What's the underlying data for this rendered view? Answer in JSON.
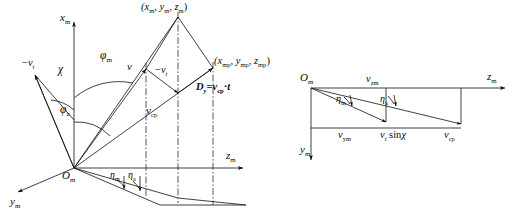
{
  "figure": {
    "type": "technical-line-diagram",
    "panels": [
      "left-3d-geometry",
      "right-velocity-triangle"
    ],
    "stroke_color": "#101010",
    "background": "#ffffff"
  },
  "left_panel": {
    "axes": [
      {
        "name": "x-axis",
        "label_base": "x",
        "label_sub": "m"
      },
      {
        "name": "y-axis",
        "label_base": "y",
        "label_sub": "m"
      },
      {
        "name": "z-axis",
        "label_base": "z",
        "label_sub": "m"
      }
    ],
    "origin": {
      "label_base": "O",
      "label_sub": "m"
    },
    "point_labels": [
      {
        "name": "target-point",
        "text": "(x",
        "sub1": "m",
        "mid1": ", y",
        "sub2": "m",
        "mid2": ", z",
        "sub3": "m",
        "tail": ")"
      },
      {
        "name": "predicted-point",
        "text": "(x",
        "sub1": "mp",
        "mid1": ", y",
        "sub2": "mp",
        "mid2": ", z",
        "sub3": "mp",
        "tail": ")"
      }
    ],
    "angles": [
      {
        "name": "phi-m",
        "base": "φ",
        "sub": "m"
      },
      {
        "name": "phi-a",
        "base": "φ",
        "sub": "a"
      },
      {
        "name": "chi",
        "base": "χ",
        "sub": ""
      },
      {
        "name": "eta-m",
        "base": "η",
        "sub": "m"
      },
      {
        "name": "eta-a",
        "base": "η",
        "sub": "a"
      }
    ],
    "vectors": [
      {
        "name": "v-vector",
        "base": "v",
        "sub": ""
      },
      {
        "name": "neg-vt-vector-left",
        "prefix": "−",
        "base": "v",
        "sub": "t"
      },
      {
        "name": "neg-vt-vector-mid",
        "prefix": "−",
        "base": "v",
        "sub": "t"
      },
      {
        "name": "vcp-vector",
        "base": "v",
        "sub": "cp"
      }
    ],
    "equation": {
      "name": "dy-equation",
      "lhs_base": "D",
      "lhs_sub": "y",
      "eq": "=",
      "rhs_base": "v",
      "rhs_sub": "cp",
      "dot": "·",
      "time": "t"
    }
  },
  "right_panel": {
    "origin": {
      "label_base": "O",
      "label_sub": "m"
    },
    "axes": [
      {
        "name": "z-axis",
        "label_base": "z",
        "label_sub": "m"
      },
      {
        "name": "y-axis",
        "label_base": "y",
        "label_sub": "m"
      }
    ],
    "angles": [
      {
        "name": "eta-m",
        "base": "η",
        "sub": "m"
      },
      {
        "name": "eta-a",
        "base": "η",
        "sub": "a"
      }
    ],
    "components": [
      {
        "name": "vzm-component",
        "base": "v",
        "sub": "zm"
      },
      {
        "name": "vym-component",
        "base": "v",
        "sub": "ym"
      },
      {
        "name": "vt-sin-chi-component",
        "base": "v",
        "sub": "t",
        "rest": " sin",
        "greek": "χ"
      },
      {
        "name": "vcp-component",
        "base": "v",
        "sub": "cp"
      }
    ]
  }
}
